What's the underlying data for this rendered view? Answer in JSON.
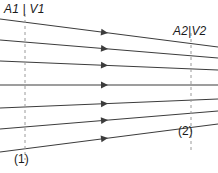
{
  "figure": {
    "name": "streamtube-flow-diagram",
    "background_color": "#ffffff",
    "stroke_color": "#3c3c3c",
    "dash_color": "#9a9a9a",
    "text_color": "#1a1a1a",
    "width": 218,
    "height": 173
  },
  "labels": {
    "inlet": "A1 | V1",
    "outlet": "A2|V2",
    "station_1": "(1)",
    "station_2": "(2)"
  },
  "stations": [
    {
      "id": "1",
      "label": "(1)",
      "x": 25,
      "y_top": 14,
      "y_bottom": 160,
      "style": "dashed"
    },
    {
      "id": "2",
      "label": "(2)",
      "x": 191,
      "y_top": 33,
      "y_bottom": 150,
      "style": "dashed"
    }
  ],
  "streamlines": [
    {
      "index": 1,
      "x1": 0,
      "y1": 19,
      "x2": 218,
      "y2": 47,
      "arrow_x": 108,
      "arrow_y": 32.9
    },
    {
      "index": 2,
      "x1": 0,
      "y1": 40,
      "x2": 218,
      "y2": 58,
      "arrow_x": 108,
      "arrow_y": 48.9
    },
    {
      "index": 3,
      "x1": 0,
      "y1": 61,
      "x2": 218,
      "y2": 70,
      "arrow_x": 108,
      "arrow_y": 65.5
    },
    {
      "index": 4,
      "x1": 0,
      "y1": 85,
      "x2": 218,
      "y2": 85,
      "arrow_x": 108,
      "arrow_y": 85.0
    },
    {
      "index": 5,
      "x1": 0,
      "y1": 108,
      "x2": 218,
      "y2": 99,
      "arrow_x": 108,
      "arrow_y": 103.5
    },
    {
      "index": 6,
      "x1": 0,
      "y1": 129,
      "x2": 218,
      "y2": 111,
      "arrow_x": 108,
      "arrow_y": 120.1
    },
    {
      "index": 7,
      "x1": 0,
      "y1": 152,
      "x2": 218,
      "y2": 124,
      "arrow_x": 108,
      "arrow_y": 138.1
    }
  ],
  "arrow": {
    "name": "flow-direction-arrow",
    "direction": "right",
    "count": 7
  }
}
